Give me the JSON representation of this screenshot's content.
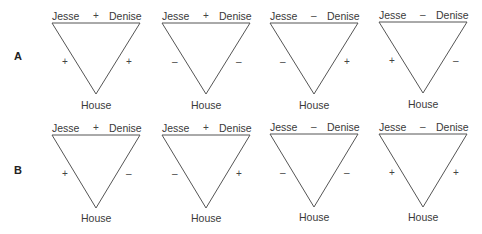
{
  "row_labels": [
    "A",
    "B"
  ],
  "nodes": {
    "left": "Jesse",
    "right": "Denise",
    "bottom": "House"
  },
  "rows": [
    {
      "label": "A",
      "triangles": [
        {
          "top": "+",
          "left": "+",
          "right": "+"
        },
        {
          "top": "+",
          "left": "–",
          "right": "–"
        },
        {
          "top": "–",
          "left": "–",
          "right": "+"
        },
        {
          "top": "–",
          "left": "+",
          "right": "–"
        }
      ]
    },
    {
      "label": "B",
      "triangles": [
        {
          "top": "+",
          "left": "+",
          "right": "–"
        },
        {
          "top": "+",
          "left": "–",
          "right": "+"
        },
        {
          "top": "–",
          "left": "–",
          "right": "–"
        },
        {
          "top": "–",
          "left": "+",
          "right": "+"
        }
      ]
    }
  ],
  "colors": {
    "line": "#555555",
    "text": "#3a3a3a"
  }
}
